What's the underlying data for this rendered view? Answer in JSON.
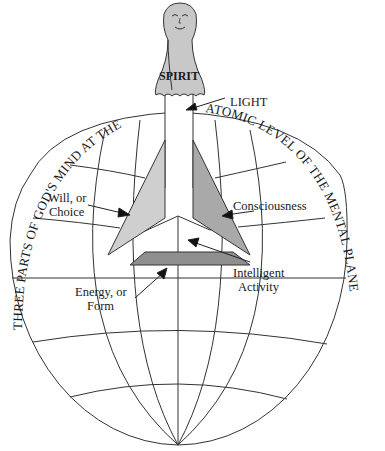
{
  "diagram": {
    "figure": "spirit-over-globe",
    "spirit_label": "SPIRIT",
    "arc_left": "THREE PARTS OF GOD'S MIND AT THE",
    "arc_right": "ATOMIC LEVEL OF THE MENTAL PLANE",
    "labels": {
      "light": "LIGHT",
      "will_line1": "Will, or",
      "will_line2": "Choice",
      "consciousness": "Consciousness",
      "intelligent_line1": "Intelligent",
      "intelligent_line2": "Activity",
      "energy_line1": "Energy, or",
      "energy_line2": "Form"
    },
    "colors": {
      "spirit_fill": "#c8c8c8",
      "left_panel": "#cfcfcf",
      "right_panel": "#a9a9a9",
      "base_panel": "#8f8f8f",
      "stroke": "#333333"
    }
  }
}
